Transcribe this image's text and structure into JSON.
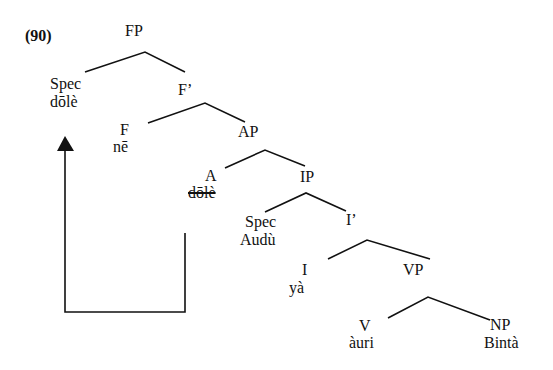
{
  "example_number": "(90)",
  "nodes": {
    "FP": {
      "label": "FP"
    },
    "SpecFP": {
      "label": "Spec",
      "word": "dōlè"
    },
    "Fbar": {
      "label": "F’"
    },
    "F": {
      "label": "F",
      "word": "nē"
    },
    "AP": {
      "label": "AP"
    },
    "A": {
      "label": "A",
      "word": "dōlè",
      "struck_through": true
    },
    "IP": {
      "label": "IP"
    },
    "SpecIP": {
      "label": "Spec",
      "word": "Audù"
    },
    "Ibar": {
      "label": "I’"
    },
    "I": {
      "label": "I",
      "word": "yà"
    },
    "VP": {
      "label": "VP"
    },
    "V": {
      "label": "V",
      "word": "àuri"
    },
    "NP": {
      "label": "NP",
      "word": "Bintà"
    }
  },
  "movement_arrow": {
    "from": "A",
    "to": "SpecFP",
    "description": "dōlè moves from A to Spec of FP"
  },
  "colors": {
    "ink": "#111111",
    "background": "#ffffff"
  }
}
